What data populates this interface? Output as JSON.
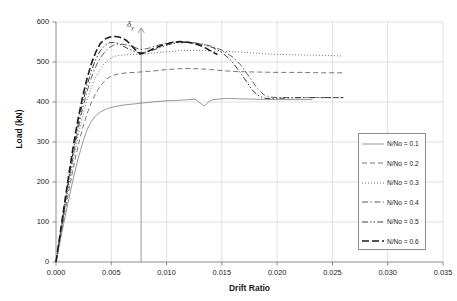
{
  "chart_data": {
    "type": "line",
    "title": "",
    "xlabel": "Drift Ratio",
    "ylabel": "Load (kN)",
    "xlim": [
      0.0,
      0.035
    ],
    "ylim": [
      0,
      600
    ],
    "xticks": [
      "0.000",
      "0.005",
      "0.010",
      "0.015",
      "0.020",
      "0.025",
      "0.030",
      "0.035"
    ],
    "xtick_values": [
      0.0,
      0.005,
      0.01,
      0.015,
      0.02,
      0.025,
      0.03,
      0.035
    ],
    "yticks": [
      "0",
      "100",
      "200",
      "300",
      "400",
      "500",
      "600"
    ],
    "ytick_values": [
      0,
      100,
      200,
      300,
      400,
      500,
      600
    ],
    "grid": "horizontal-and-vertical",
    "legend_position": "right-middle",
    "annotations": [
      {
        "name": "yield-drift-marker",
        "label": "δ",
        "subscript": "y",
        "x": 0.0077,
        "type": "vertical-line-with-arrow"
      }
    ],
    "series": [
      {
        "name": "N/No = 0.1",
        "label": "N/No = 0.1",
        "style": "solid",
        "color": "#6e6e6e",
        "width": 0.7,
        "points": [
          [
            0.0,
            0
          ],
          [
            0.0004,
            55
          ],
          [
            0.0008,
            110
          ],
          [
            0.0012,
            163
          ],
          [
            0.0016,
            213
          ],
          [
            0.002,
            258
          ],
          [
            0.0024,
            297
          ],
          [
            0.0028,
            330
          ],
          [
            0.0032,
            352
          ],
          [
            0.0036,
            366
          ],
          [
            0.004,
            375
          ],
          [
            0.0046,
            383
          ],
          [
            0.0052,
            388
          ],
          [
            0.006,
            392
          ],
          [
            0.007,
            395
          ],
          [
            0.008,
            398
          ],
          [
            0.009,
            401
          ],
          [
            0.01,
            403
          ],
          [
            0.011,
            404
          ],
          [
            0.012,
            406
          ],
          [
            0.0126,
            407
          ],
          [
            0.013,
            398
          ],
          [
            0.0134,
            390
          ],
          [
            0.0138,
            400
          ],
          [
            0.0142,
            406
          ],
          [
            0.015,
            408
          ],
          [
            0.0158,
            409
          ],
          [
            0.0166,
            408
          ],
          [
            0.018,
            407
          ],
          [
            0.02,
            406
          ],
          [
            0.022,
            406
          ],
          [
            0.0232,
            406
          ]
        ]
      },
      {
        "name": "N/No = 0.2",
        "label": "N/No = 0.2",
        "style": "dashed",
        "color": "#555555",
        "width": 0.8,
        "points": [
          [
            0.0,
            0
          ],
          [
            0.0004,
            62
          ],
          [
            0.0008,
            124
          ],
          [
            0.0012,
            184
          ],
          [
            0.0016,
            240
          ],
          [
            0.002,
            291
          ],
          [
            0.0024,
            334
          ],
          [
            0.0028,
            370
          ],
          [
            0.0032,
            399
          ],
          [
            0.0036,
            422
          ],
          [
            0.004,
            440
          ],
          [
            0.0045,
            456
          ],
          [
            0.005,
            465
          ],
          [
            0.0056,
            470
          ],
          [
            0.0064,
            473
          ],
          [
            0.0072,
            474
          ],
          [
            0.008,
            476
          ],
          [
            0.009,
            478
          ],
          [
            0.01,
            481
          ],
          [
            0.011,
            483
          ],
          [
            0.012,
            484
          ],
          [
            0.013,
            483
          ],
          [
            0.014,
            481
          ],
          [
            0.0152,
            478
          ],
          [
            0.0164,
            476
          ],
          [
            0.018,
            475
          ],
          [
            0.02,
            474
          ],
          [
            0.022,
            474
          ],
          [
            0.024,
            473
          ],
          [
            0.026,
            473
          ]
        ]
      },
      {
        "name": "N/No = 0.3",
        "label": "N/No = 0.3",
        "style": "dotted",
        "color": "#666666",
        "width": 0.9,
        "points": [
          [
            0.0,
            0
          ],
          [
            0.0004,
            66
          ],
          [
            0.0008,
            133
          ],
          [
            0.0012,
            198
          ],
          [
            0.0016,
            258
          ],
          [
            0.002,
            314
          ],
          [
            0.0024,
            363
          ],
          [
            0.0028,
            404
          ],
          [
            0.0032,
            437
          ],
          [
            0.0036,
            463
          ],
          [
            0.004,
            482
          ],
          [
            0.0044,
            497
          ],
          [
            0.0048,
            507
          ],
          [
            0.0052,
            513
          ],
          [
            0.0056,
            516
          ],
          [
            0.0062,
            518
          ],
          [
            0.007,
            519
          ],
          [
            0.0078,
            520
          ],
          [
            0.0086,
            522
          ],
          [
            0.0094,
            524
          ],
          [
            0.0102,
            526
          ],
          [
            0.011,
            528
          ],
          [
            0.0118,
            529
          ],
          [
            0.0126,
            529
          ],
          [
            0.0136,
            528
          ],
          [
            0.0146,
            527
          ],
          [
            0.0158,
            526
          ],
          [
            0.0172,
            524
          ],
          [
            0.0186,
            521
          ],
          [
            0.02,
            519
          ],
          [
            0.0215,
            518
          ],
          [
            0.0232,
            517
          ],
          [
            0.0248,
            516
          ],
          [
            0.0258,
            515
          ]
        ]
      },
      {
        "name": "N/No = 0.4",
        "label": "N/No = 0.4",
        "style": "dashdot",
        "color": "#4a4a4a",
        "width": 0.9,
        "points": [
          [
            0.0,
            0
          ],
          [
            0.0004,
            70
          ],
          [
            0.0008,
            140
          ],
          [
            0.0012,
            209
          ],
          [
            0.0016,
            272
          ],
          [
            0.002,
            331
          ],
          [
            0.0024,
            383
          ],
          [
            0.0028,
            426
          ],
          [
            0.0032,
            461
          ],
          [
            0.0036,
            489
          ],
          [
            0.004,
            510
          ],
          [
            0.0044,
            525
          ],
          [
            0.0048,
            536
          ],
          [
            0.0052,
            542
          ],
          [
            0.0056,
            545
          ],
          [
            0.0062,
            544
          ],
          [
            0.007,
            538
          ],
          [
            0.0076,
            531
          ],
          [
            0.0082,
            533
          ],
          [
            0.009,
            540
          ],
          [
            0.0098,
            546
          ],
          [
            0.0106,
            550
          ],
          [
            0.0114,
            551
          ],
          [
            0.0122,
            549
          ],
          [
            0.013,
            546
          ],
          [
            0.014,
            540
          ],
          [
            0.015,
            530
          ],
          [
            0.016,
            512
          ],
          [
            0.0168,
            490
          ],
          [
            0.0175,
            462
          ],
          [
            0.0182,
            434
          ],
          [
            0.0188,
            418
          ],
          [
            0.0194,
            412
          ],
          [
            0.0202,
            411
          ],
          [
            0.0215,
            411
          ],
          [
            0.023,
            411
          ],
          [
            0.0248,
            411
          ],
          [
            0.026,
            411
          ]
        ]
      },
      {
        "name": "N/No = 0.5",
        "label": "N/No = 0.5",
        "style": "dashdotdot",
        "color": "#3d3d3d",
        "width": 1.0,
        "points": [
          [
            0.0,
            0
          ],
          [
            0.0004,
            73
          ],
          [
            0.0008,
            146
          ],
          [
            0.0012,
            217
          ],
          [
            0.0016,
            284
          ],
          [
            0.002,
            344
          ],
          [
            0.0024,
            397
          ],
          [
            0.0028,
            441
          ],
          [
            0.0032,
            478
          ],
          [
            0.0036,
            507
          ],
          [
            0.004,
            528
          ],
          [
            0.0044,
            541
          ],
          [
            0.0048,
            548
          ],
          [
            0.0052,
            549
          ],
          [
            0.0056,
            547
          ],
          [
            0.006,
            541
          ],
          [
            0.0066,
            532
          ],
          [
            0.0072,
            525
          ],
          [
            0.0078,
            523
          ],
          [
            0.0086,
            528
          ],
          [
            0.0094,
            536
          ],
          [
            0.0102,
            544
          ],
          [
            0.011,
            548
          ],
          [
            0.0118,
            549
          ],
          [
            0.0126,
            547
          ],
          [
            0.0134,
            543
          ],
          [
            0.0142,
            536
          ],
          [
            0.015,
            524
          ],
          [
            0.0158,
            505
          ],
          [
            0.0165,
            480
          ],
          [
            0.0172,
            452
          ],
          [
            0.0178,
            428
          ],
          [
            0.0184,
            414
          ],
          [
            0.019,
            409
          ],
          [
            0.0198,
            409
          ],
          [
            0.021,
            410
          ],
          [
            0.0222,
            411
          ],
          [
            0.0236,
            411
          ],
          [
            0.025,
            411
          ],
          [
            0.026,
            411
          ]
        ]
      },
      {
        "name": "N/No = 0.6",
        "label": "N/No = 0.6",
        "style": "thick-dashed",
        "color": "#1c1c1c",
        "width": 1.6,
        "points": [
          [
            0.0,
            0
          ],
          [
            0.0004,
            76
          ],
          [
            0.0008,
            152
          ],
          [
            0.0012,
            226
          ],
          [
            0.0016,
            296
          ],
          [
            0.002,
            358
          ],
          [
            0.0024,
            412
          ],
          [
            0.0028,
            458
          ],
          [
            0.0032,
            496
          ],
          [
            0.0036,
            525
          ],
          [
            0.004,
            546
          ],
          [
            0.0044,
            557
          ],
          [
            0.0048,
            562
          ],
          [
            0.0052,
            564
          ],
          [
            0.0056,
            563
          ],
          [
            0.006,
            560
          ],
          [
            0.0064,
            553
          ],
          [
            0.0068,
            542
          ],
          [
            0.0072,
            530
          ],
          [
            0.0076,
            520
          ],
          [
            0.0082,
            525
          ],
          [
            0.0088,
            533
          ],
          [
            0.0094,
            540
          ],
          [
            0.01,
            545
          ],
          [
            0.0106,
            549
          ],
          [
            0.0112,
            551
          ],
          [
            0.0118,
            550
          ],
          [
            0.0124,
            547
          ],
          [
            0.013,
            542
          ],
          [
            0.0136,
            534
          ],
          [
            0.0142,
            524
          ],
          [
            0.0146,
            519
          ]
        ]
      }
    ]
  },
  "axes": {
    "x_title": "Drift Ratio",
    "y_title": "Load (kN)"
  },
  "legend": {
    "items": [
      {
        "label": "N/No = 0.1"
      },
      {
        "label": "N/No = 0.2"
      },
      {
        "label": "N/No = 0.3"
      },
      {
        "label": "N/No = 0.4"
      },
      {
        "label": "N/No = 0.5"
      },
      {
        "label": "N/No = 0.6"
      }
    ]
  },
  "annotation": {
    "delta": "δ",
    "subscript": "y"
  },
  "colors": {
    "grid": "#cfcfcf",
    "axis": "#808080",
    "text": "#1a1a1a",
    "refline": "#808080"
  }
}
